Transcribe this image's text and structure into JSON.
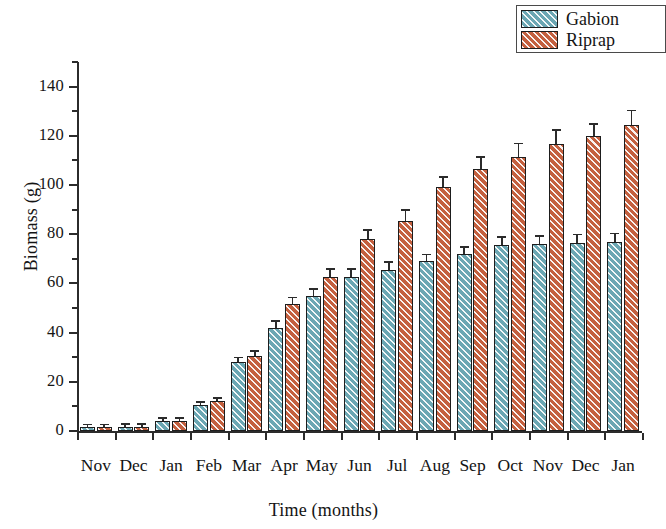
{
  "chart_data": {
    "type": "bar",
    "title": "",
    "xlabel": "Time (months)",
    "ylabel": "Biomass (g)",
    "categories": [
      "Nov",
      "Dec",
      "Jan",
      "Feb",
      "Mar",
      "Apr",
      "May",
      "Jun",
      "Jul",
      "Aug",
      "Sep",
      "Oct",
      "Nov",
      "Dec",
      "Jan"
    ],
    "series": [
      {
        "name": "Gabion",
        "color": "#6ba7b3",
        "values": [
          1.5,
          1.8,
          4.0,
          10.5,
          28.0,
          42.0,
          55.0,
          62.5,
          65.5,
          69.0,
          72.0,
          75.5,
          76.0,
          76.5,
          77.0
        ],
        "errors": [
          0.8,
          0.8,
          1.0,
          1.0,
          1.5,
          2.5,
          2.5,
          3.0,
          3.0,
          2.5,
          2.5,
          3.0,
          3.0,
          3.0,
          3.0
        ]
      },
      {
        "name": "Riprap",
        "color": "#c4603f",
        "values": [
          1.5,
          1.8,
          4.0,
          12.0,
          30.5,
          51.5,
          62.5,
          78.0,
          85.5,
          99.0,
          106.5,
          111.5,
          116.5,
          120.0,
          124.5
        ],
        "errors": [
          0.8,
          0.8,
          1.0,
          1.2,
          1.8,
          2.5,
          3.0,
          3.5,
          4.0,
          4.0,
          4.5,
          5.0,
          5.5,
          4.5,
          5.5
        ]
      }
    ],
    "ylim": [
      0,
      150
    ],
    "y_major_ticks": [
      0,
      20,
      40,
      60,
      80,
      100,
      120,
      140
    ],
    "y_minor_ticks": [
      10,
      30,
      50,
      70,
      90,
      110,
      130,
      150
    ],
    "grid": false,
    "legend_position": "top-right"
  },
  "legend": {
    "entries": [
      {
        "label": "Gabion"
      },
      {
        "label": "Riprap"
      }
    ]
  }
}
